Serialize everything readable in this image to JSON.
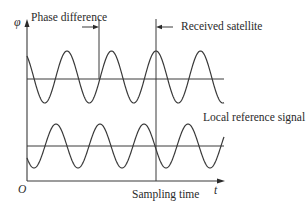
{
  "diagram": {
    "axes": {
      "y_label": "φ",
      "x_label": "t",
      "origin_label": "O"
    },
    "annotations": {
      "phase_difference": "Phase difference",
      "received_satellite": "Received satellite",
      "local_reference": "Local reference signal",
      "sampling_time": "Sampling time"
    },
    "signals": [
      {
        "name": "Received satellite signal",
        "center_y": 77,
        "amplitude": 26,
        "period_px": 44.5,
        "peak_x": 156
      },
      {
        "name": "Local reference signal",
        "center_y": 146,
        "amplitude": 22,
        "period_px": 44,
        "peak_x": 144
      }
    ],
    "colors": {
      "line": "#3a3a3a",
      "background": "#ffffff"
    }
  }
}
